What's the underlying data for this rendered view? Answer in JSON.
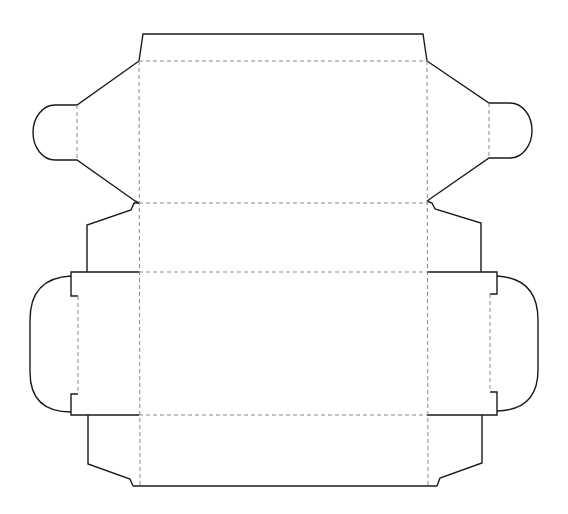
{
  "diagram": {
    "type": "box-dieline",
    "colors": {
      "background": "#ffffff",
      "cut_line": "#1a1a1a",
      "fold_line": "#8a8a8a"
    },
    "line_styles": {
      "cut": "solid",
      "fold": "dashed"
    },
    "panels": [
      {
        "name": "top-lid-tuck-flap",
        "bounds": [
          139,
          34,
          427,
          61
        ]
      },
      {
        "name": "lid-panel",
        "bounds": [
          139,
          61,
          427,
          203
        ]
      },
      {
        "name": "back-panel",
        "bounds": [
          139,
          203,
          427,
          272
        ]
      },
      {
        "name": "base-panel",
        "bounds": [
          139,
          272,
          427,
          415
        ]
      },
      {
        "name": "front-panel",
        "bounds": [
          139,
          415,
          427,
          486
        ]
      },
      {
        "name": "left-rounded-dust-flap",
        "bounds": [
          34,
          61,
          139,
          203
        ]
      },
      {
        "name": "right-rounded-dust-flap",
        "bounds": [
          427,
          61,
          532,
          203
        ]
      },
      {
        "name": "left-upper-side-flap",
        "bounds": [
          87,
          203,
          139,
          272
        ]
      },
      {
        "name": "right-upper-side-flap",
        "bounds": [
          427,
          203,
          481,
          272
        ]
      },
      {
        "name": "left-side-tab",
        "bounds": [
          30,
          272,
          139,
          415
        ]
      },
      {
        "name": "right-side-tab",
        "bounds": [
          427,
          272,
          540,
          415
        ]
      },
      {
        "name": "left-lower-side-flap",
        "bounds": [
          88,
          415,
          139,
          486
        ]
      },
      {
        "name": "right-lower-side-flap",
        "bounds": [
          427,
          415,
          482,
          486
        ]
      }
    ]
  }
}
